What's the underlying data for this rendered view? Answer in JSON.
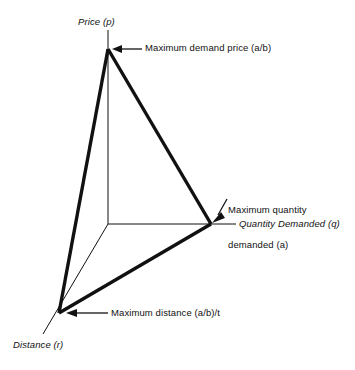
{
  "figure": {
    "background_color": "#ffffff",
    "ink_color": "#111111"
  },
  "axes": [
    {
      "id": "price",
      "label": "Price (p)",
      "style": "italic",
      "direction": "up"
    },
    {
      "id": "quantity",
      "label": "Quantity Demanded (q)",
      "style": "italic",
      "direction": "right"
    },
    {
      "id": "distance",
      "label": "Distance (r)",
      "style": "italic",
      "direction": "down-left"
    }
  ],
  "annotations": [
    {
      "id": "max-demand-price",
      "label": "Maximum demand price (a/b)",
      "arrow": "left",
      "points_to": "price-vertex"
    },
    {
      "id": "max-quantity-demanded",
      "label": "Maximum quantity\ndemanded (a)",
      "line1": "Maximum quantity",
      "line2": "demanded (a)",
      "arrow": "down-left",
      "points_to": "quantity-vertex"
    },
    {
      "id": "max-distance",
      "label": "Maximum distance (a/b)/t",
      "arrow": "left",
      "points_to": "distance-vertex"
    }
  ],
  "geometry": {
    "origin": {
      "x": 108,
      "y": 224
    },
    "vertices": {
      "price": {
        "x": 108,
        "y": 49
      },
      "quantity": {
        "x": 211,
        "y": 224
      },
      "distance": {
        "x": 59,
        "y": 313
      }
    },
    "axis_tips": {
      "price": {
        "x": 108,
        "y": 30
      },
      "quantity": {
        "x": 236,
        "y": 224
      },
      "distance": {
        "x": 43,
        "y": 334
      }
    }
  }
}
